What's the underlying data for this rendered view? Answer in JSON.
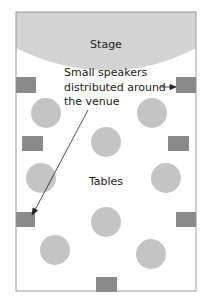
{
  "diagram": {
    "stage_label": "Stage",
    "tables_label": "Tables",
    "annotation": {
      "line1": "Small speakers",
      "line2": "distributed around",
      "line3": "the venue"
    },
    "colors": {
      "frame": "#9a9a9a",
      "stage": "#d3d3d3",
      "table": "#c4c4c4",
      "speaker": "#8a8a8a",
      "arrow": "#222222"
    },
    "tables_count": 8,
    "speakers_count": 5
  }
}
